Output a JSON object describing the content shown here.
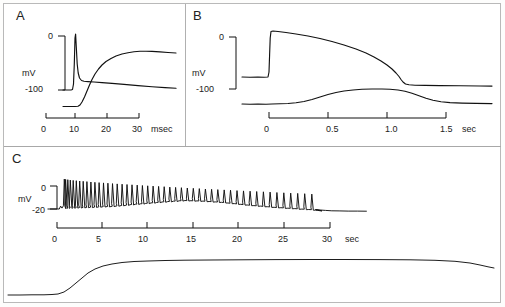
{
  "figure": {
    "panels": [
      {
        "id": "A",
        "label": "A",
        "yaxis": {
          "unit": "mV",
          "ticks": [
            "0",
            "-100"
          ],
          "max": 0,
          "min": -100
        },
        "xaxis": {
          "unit": "msec",
          "ticks": [
            "0",
            "10",
            "20",
            "30"
          ],
          "min": 0,
          "max": 30
        }
      },
      {
        "id": "B",
        "label": "B",
        "yaxis": {
          "unit": "mV",
          "ticks": [
            "0",
            "-100"
          ],
          "max": 0,
          "min": -100
        },
        "xaxis": {
          "unit": "sec",
          "ticks": [
            "0",
            "0.5",
            "1.0",
            "1.5"
          ],
          "min": 0,
          "max": 1.5
        }
      },
      {
        "id": "C",
        "label": "C",
        "yaxis": {
          "unit": "mV",
          "ticks": [
            "0",
            "-20"
          ],
          "max": 0,
          "min": -20
        },
        "xaxis": {
          "unit": "sec",
          "ticks": [
            "0",
            "5",
            "10",
            "15",
            "20",
            "25",
            "30"
          ],
          "min": 0,
          "max": 30
        }
      }
    ],
    "colors": {
      "trace": "#111111",
      "frame": "#b9b9b9",
      "background": "#ffffff"
    }
  },
  "chart_data": [
    {
      "type": "line",
      "title": "A",
      "xlabel": "msec",
      "ylabel": "mV",
      "xlim": [
        0,
        36
      ],
      "ylim": [
        -110,
        40
      ],
      "grid": false,
      "legend": "none",
      "series": [
        {
          "name": "action-potential",
          "comment": "fast spike from -100 mV rising to about +30 mV at ~8 msec, repolarizing to a slowly declining plateau near -70 mV",
          "x": [
            0,
            2,
            4,
            6,
            7,
            7.4,
            7.8,
            8.0,
            8.3,
            8.7,
            9.2,
            9.8,
            10.6,
            11.6,
            13,
            16,
            20,
            25,
            30,
            34,
            36
          ],
          "y": [
            -100,
            -100,
            -100,
            -100,
            -99,
            -80,
            -20,
            30,
            20,
            -25,
            -55,
            -66,
            -70,
            -71,
            -71,
            -72,
            -73,
            -75,
            -77,
            -79,
            -80
          ]
        },
        {
          "name": "conductance-or-current",
          "comment": "sigmoidal rise beginning at ~9 msec, saturating near 28-30 msec then slightly declining",
          "x": [
            0,
            4,
            8,
            9,
            10,
            11,
            12,
            13,
            14,
            16,
            18,
            20,
            22,
            24,
            26,
            28,
            30,
            32,
            34,
            36
          ],
          "y": [
            -100,
            -100,
            -100,
            -99,
            -96,
            -88,
            -76,
            -63,
            -52,
            -36,
            -26,
            -20,
            -15,
            -11,
            -8,
            -6,
            -5,
            -6,
            -7,
            -8
          ]
        }
      ]
    },
    {
      "type": "line",
      "title": "B",
      "xlabel": "sec",
      "ylabel": "mV",
      "xlim": [
        -0.25,
        1.95
      ],
      "ylim": [
        -115,
        15
      ],
      "grid": false,
      "legend": "none",
      "series": [
        {
          "name": "plateau-potential",
          "comment": "steps from -75 mV to +5 mV at t=0, slowly decays, then falls sharply at ~1.08 sec back to -78 mV",
          "x": [
            -0.25,
            -0.02,
            0.0,
            0.02,
            0.06,
            0.15,
            0.3,
            0.45,
            0.6,
            0.72,
            0.82,
            0.9,
            0.97,
            1.02,
            1.06,
            1.09,
            1.12,
            1.2,
            1.4,
            1.7,
            1.95
          ],
          "y": [
            -75,
            -75,
            -60,
            6,
            3,
            0,
            -5,
            -12,
            -22,
            -32,
            -42,
            -52,
            -62,
            -68,
            -72,
            -76,
            -78,
            -78,
            -78,
            -78,
            -78
          ]
        },
        {
          "name": "slow-bump",
          "comment": "bell-shaped slow potential rising from -100 mV, peaking near -85 mV at ~1.0 sec, decaying back by ~1.4 sec",
          "x": [
            -0.25,
            0.0,
            0.15,
            0.28,
            0.38,
            0.48,
            0.58,
            0.68,
            0.78,
            0.9,
            1.0,
            1.08,
            1.15,
            1.22,
            1.3,
            1.4,
            1.5,
            1.7,
            1.95
          ],
          "y": [
            -100,
            -100,
            -100,
            -99,
            -97,
            -94,
            -91,
            -89,
            -87,
            -86,
            -85,
            -85,
            -86,
            -88,
            -92,
            -96,
            -98,
            -99,
            -99
          ]
        }
      ]
    },
    {
      "type": "line",
      "title": "C",
      "xlabel": "sec",
      "ylabel": "mV",
      "xlim": [
        -1,
        34
      ],
      "ylim": [
        -26,
        12
      ],
      "grid": false,
      "legend": "none",
      "series": [
        {
          "name": "spike-train",
          "comment": "repetitive firing: ~48 action potentials beginning at t~0.8 sec with adaptation; inter-spike interval lengthens and spike amplitude declines through the train, firing stops at ~28 sec",
          "spike_count": 48,
          "first_spike_time": 0.8,
          "last_spike_time": 28.0,
          "baseline_mV_start": -20,
          "baseline_peak_mV": -12,
          "baseline_peak_time": 14,
          "spike_peak_mV_start": 6,
          "spike_peak_mV_end": -7
        },
        {
          "name": "envelope-baseline",
          "comment": "slow depolarizing envelope underlying the spike train, from -20 mV up to about -12 mV near 14 sec then repolarizing to -21 mV after firing ends",
          "x": [
            -1,
            0,
            0.5,
            1,
            3,
            6,
            9,
            12,
            14,
            16,
            18,
            21,
            24,
            27,
            28,
            29,
            30,
            32,
            34
          ],
          "y": [
            -20,
            -20,
            -19,
            -18.5,
            -18,
            -17,
            -15,
            -13,
            -12,
            -12.5,
            -13.5,
            -16,
            -18,
            -19.5,
            -20,
            -21,
            -21.5,
            -21.8,
            -21.9
          ]
        },
        {
          "name": "bottom-stimulus-trace",
          "comment": "slow sigmoidal stimulus/secretion trace at the bottom of panel C, rising from baseline at ~2 sec and plateauing by ~9 sec, with a small decline after 30 sec",
          "x": [
            -1,
            1,
            2,
            3,
            4,
            5,
            6,
            7,
            8,
            9,
            11,
            14,
            18,
            22,
            26,
            29,
            31,
            32.5,
            34
          ],
          "y": [
            0,
            0,
            0.2,
            2,
            6,
            11,
            15,
            18,
            20,
            21,
            21.8,
            22.2,
            22.5,
            22.6,
            22.6,
            22.5,
            22.2,
            21.2,
            20.3
          ]
        }
      ]
    }
  ]
}
